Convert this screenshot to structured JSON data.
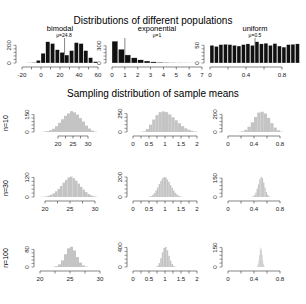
{
  "title": "Distributions of different populations",
  "subtitle": "Sampling distribution of sample means",
  "colors": {
    "population_bar": "#111111",
    "sampling_bar": "#c4c4c4",
    "axis": "#333333",
    "mean_line": "#555555"
  },
  "chart_data": [
    {
      "type": "bar",
      "panel": "population-bimodal",
      "title": "bimodal",
      "annotation": "μ=24.8",
      "mean": 24.8,
      "x": [
        -20,
        -15,
        -10,
        -5,
        0,
        5,
        10,
        15,
        20,
        25,
        30,
        35,
        40,
        45,
        50,
        55
      ],
      "bin_width": 5,
      "values": [
        0,
        2,
        5,
        30,
        110,
        240,
        220,
        150,
        120,
        90,
        140,
        230,
        220,
        140,
        60,
        15
      ],
      "xticks": [
        -20,
        0,
        20,
        40,
        60
      ],
      "yticks": [
        0,
        200
      ],
      "xlim": [
        -20,
        60
      ],
      "ylim": [
        0,
        260
      ]
    },
    {
      "type": "bar",
      "panel": "population-exponential",
      "title": "exponential",
      "annotation": "μ=1",
      "mean": 1,
      "x": [
        0,
        0.5,
        1,
        1.5,
        2,
        2.5,
        3,
        3.5,
        4,
        4.5,
        5,
        5.5,
        6,
        6.5
      ],
      "bin_width": 0.5,
      "values": [
        380,
        240,
        140,
        90,
        55,
        35,
        20,
        12,
        7,
        4,
        3,
        2,
        1,
        1
      ],
      "xticks": [
        0,
        1,
        2,
        3,
        4,
        5,
        6,
        7
      ],
      "yticks": [
        0,
        300
      ],
      "xlim": [
        0,
        7
      ],
      "ylim": [
        0,
        400
      ]
    },
    {
      "type": "bar",
      "panel": "population-uniform",
      "title": "uniform",
      "annotation": "μ=0.5",
      "mean": 0.5,
      "x": [
        0,
        0.05,
        0.1,
        0.15,
        0.2,
        0.25,
        0.3,
        0.35,
        0.4,
        0.45,
        0.5,
        0.55,
        0.6,
        0.65,
        0.7,
        0.75,
        0.8,
        0.85,
        0.9,
        0.95
      ],
      "bin_width": 0.05,
      "values": [
        50,
        47,
        52,
        53,
        52,
        50,
        48,
        52,
        54,
        50,
        60,
        54,
        56,
        50,
        55,
        48,
        45,
        52,
        53,
        54
      ],
      "xticks": [
        0.0,
        0.4,
        0.8
      ],
      "yticks": [
        0,
        50
      ],
      "xlim": [
        0,
        1
      ],
      "ylim": [
        0,
        65
      ]
    },
    {
      "type": "bar",
      "panel": "n10-bimodal",
      "row_label": "n=10",
      "x": [
        14,
        15,
        16,
        17,
        18,
        19,
        20,
        21,
        22,
        23,
        24,
        25,
        26,
        27,
        28,
        29,
        30,
        31,
        32
      ],
      "bin_width": 1,
      "values": [
        1,
        3,
        8,
        15,
        28,
        50,
        80,
        110,
        140,
        160,
        180,
        170,
        150,
        120,
        90,
        55,
        30,
        12,
        4
      ],
      "xticks": [
        20,
        25,
        30
      ],
      "yticks": [
        0,
        150
      ],
      "xlim": [
        14,
        34
      ],
      "ylim": [
        0,
        190
      ]
    },
    {
      "type": "bar",
      "panel": "n10-exponential",
      "x": [
        0.2,
        0.3,
        0.4,
        0.5,
        0.6,
        0.7,
        0.8,
        0.9,
        1.0,
        1.1,
        1.2,
        1.3,
        1.4,
        1.5,
        1.6,
        1.7,
        1.8,
        1.9
      ],
      "bin_width": 0.1,
      "values": [
        2,
        10,
        40,
        100,
        170,
        230,
        270,
        280,
        270,
        240,
        200,
        160,
        120,
        80,
        50,
        30,
        15,
        6
      ],
      "xticks": [
        0.0,
        0.5,
        1.0,
        1.5,
        2.0
      ],
      "yticks": [
        0,
        250
      ],
      "xlim": [
        0,
        2
      ],
      "ylim": [
        0,
        300
      ]
    },
    {
      "type": "bar",
      "panel": "n10-uniform",
      "x": [
        0.15,
        0.2,
        0.25,
        0.3,
        0.35,
        0.4,
        0.45,
        0.5,
        0.55,
        0.6,
        0.65,
        0.7,
        0.75,
        0.8
      ],
      "bin_width": 0.05,
      "values": [
        2,
        8,
        25,
        60,
        110,
        170,
        220,
        230,
        210,
        160,
        100,
        50,
        20,
        5
      ],
      "xticks": [
        0.0,
        0.4,
        0.8
      ],
      "yticks": [
        0,
        200
      ],
      "xlim": [
        0,
        1
      ],
      "ylim": [
        0,
        250
      ]
    },
    {
      "type": "bar",
      "panel": "n30-bimodal",
      "row_label": "n=30",
      "x": [
        19,
        19.5,
        20,
        20.5,
        21,
        21.5,
        22,
        22.5,
        23,
        23.5,
        24,
        24.5,
        25,
        25.5,
        26,
        26.5,
        27,
        27.5,
        28,
        28.5,
        29,
        29.5,
        30
      ],
      "bin_width": 0.5,
      "values": [
        1,
        2,
        4,
        8,
        14,
        22,
        35,
        50,
        68,
        88,
        105,
        120,
        125,
        115,
        100,
        82,
        62,
        45,
        30,
        18,
        10,
        5,
        2
      ],
      "xticks": [
        20,
        25,
        30
      ],
      "yticks": [
        0,
        120
      ],
      "xlim": [
        19,
        31
      ],
      "ylim": [
        0,
        135
      ]
    },
    {
      "type": "bar",
      "panel": "n30-exponential",
      "x": [
        0.45,
        0.5,
        0.55,
        0.6,
        0.65,
        0.7,
        0.75,
        0.8,
        0.85,
        0.9,
        0.95,
        1.0,
        1.05,
        1.1,
        1.15,
        1.2,
        1.25,
        1.3,
        1.35,
        1.4,
        1.45,
        1.5
      ],
      "bin_width": 0.05,
      "values": [
        1,
        4,
        10,
        22,
        40,
        65,
        95,
        130,
        160,
        185,
        200,
        195,
        175,
        150,
        120,
        92,
        65,
        42,
        26,
        14,
        7,
        3
      ],
      "xticks": [
        0.0,
        0.5,
        1.0,
        1.5,
        2.0
      ],
      "yticks": [
        0,
        200
      ],
      "xlim": [
        0,
        2
      ],
      "ylim": [
        0,
        220
      ]
    },
    {
      "type": "bar",
      "panel": "n30-uniform",
      "x": [
        0.36,
        0.38,
        0.4,
        0.42,
        0.44,
        0.46,
        0.48,
        0.5,
        0.52,
        0.54,
        0.56,
        0.58,
        0.6,
        0.62,
        0.64
      ],
      "bin_width": 0.02,
      "values": [
        2,
        6,
        15,
        35,
        65,
        100,
        140,
        160,
        150,
        115,
        75,
        40,
        18,
        6,
        2
      ],
      "xticks": [
        0.0,
        0.4,
        0.8
      ],
      "yticks": [
        0,
        150
      ],
      "xlim": [
        0,
        1
      ],
      "ylim": [
        0,
        175
      ]
    },
    {
      "type": "bar",
      "panel": "n100-bimodal",
      "row_label": "n=100",
      "x": [
        22,
        22.5,
        23,
        23.5,
        24,
        24.5,
        25,
        25.5,
        26,
        26.5,
        27,
        27.5
      ],
      "bin_width": 0.5,
      "values": [
        1,
        4,
        12,
        30,
        58,
        85,
        92,
        75,
        45,
        20,
        7,
        2
      ],
      "xticks": [
        20,
        25,
        30
      ],
      "yticks": [
        0,
        80
      ],
      "xlim": [
        20,
        30
      ],
      "ylim": [
        0,
        100
      ]
    },
    {
      "type": "bar",
      "panel": "n100-exponential",
      "x": [
        0.7,
        0.75,
        0.8,
        0.85,
        0.9,
        0.95,
        1.0,
        1.05,
        1.1,
        1.15,
        1.2,
        1.25,
        1.3
      ],
      "bin_width": 0.05,
      "values": [
        5,
        25,
        80,
        180,
        300,
        390,
        410,
        340,
        230,
        130,
        60,
        20,
        5
      ],
      "xticks": [
        0.0,
        0.5,
        1.0,
        1.5,
        2.0
      ],
      "yticks": [
        0,
        400
      ],
      "xlim": [
        0,
        2
      ],
      "ylim": [
        0,
        450
      ]
    },
    {
      "type": "bar",
      "panel": "n100-uniform",
      "x": [
        0.44,
        0.45,
        0.46,
        0.47,
        0.48,
        0.49,
        0.5,
        0.51,
        0.52,
        0.53,
        0.54,
        0.55,
        0.56
      ],
      "bin_width": 0.01,
      "values": [
        2,
        8,
        22,
        50,
        90,
        130,
        150,
        135,
        95,
        55,
        25,
        8,
        2
      ],
      "xticks": [
        0.0,
        0.4,
        0.8
      ],
      "yticks": [
        0,
        150
      ],
      "xlim": [
        0,
        1
      ],
      "ylim": [
        0,
        170
      ]
    }
  ]
}
